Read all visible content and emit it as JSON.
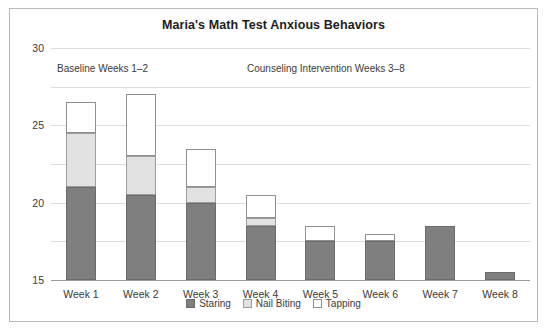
{
  "chart_data": {
    "type": "bar",
    "stacked": true,
    "title": "Maria's Math Test Anxious Behaviors",
    "xlabel": "",
    "ylabel": "",
    "ylim": [
      0,
      30
    ],
    "yticks": [
      0,
      5,
      10,
      15,
      20,
      25,
      30
    ],
    "grid": true,
    "legend_position": "bottom",
    "categories": [
      "Week 1",
      "Week 2",
      "Week 3",
      "Week 4",
      "Week 5",
      "Week 6",
      "Week 7",
      "Week 8"
    ],
    "series": [
      {
        "name": "Staring",
        "color": "#7f7f7f",
        "values": [
          12,
          11,
          10,
          7,
          5,
          5,
          7,
          1
        ]
      },
      {
        "name": "Nail Biting",
        "color": "#e2e2e2",
        "values": [
          7,
          5,
          2,
          1,
          0,
          0,
          0,
          0
        ]
      },
      {
        "name": "Tapping",
        "color": "#ffffff",
        "values": [
          4,
          8,
          5,
          3,
          2,
          1,
          0,
          0
        ]
      }
    ],
    "totals": [
      23,
      24,
      17,
      11,
      7,
      6,
      7,
      1
    ],
    "annotations": [
      {
        "text": "Baseline Weeks 1–2"
      },
      {
        "text": "Counseling Intervention Weeks 3–8"
      }
    ]
  }
}
